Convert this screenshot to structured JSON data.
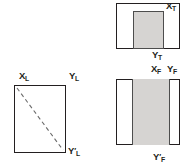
{
  "diagram": {
    "background_color": "#ffffff",
    "outline_color": "#231f20",
    "shade_color": "#d6d4d2",
    "shade_border_color": "#4d4d4d",
    "dash_color": "#6b6b6b",
    "views": [
      {
        "id": "top-view",
        "name": "top-view",
        "shape": "rectangle-with-inset-shaded-block",
        "position": {
          "x": 116,
          "y": 3,
          "width": 64,
          "height": 46
        },
        "shaded_block": {
          "x": 17,
          "y": 8,
          "width": 31,
          "height": 38
        },
        "labels": [
          {
            "id": "x-t",
            "base": "X",
            "sub": "T",
            "prime": false,
            "x": 166,
            "y": 1
          },
          {
            "id": "y-t",
            "base": "Y",
            "sub": "T",
            "prime": false,
            "x": 152,
            "y": 50
          }
        ]
      },
      {
        "id": "left-view",
        "name": "left-view",
        "shape": "rectangle-with-dashed-diagonal",
        "position": {
          "x": 14,
          "y": 85,
          "width": 52,
          "height": 68
        },
        "diagonal": {
          "x1": 3,
          "y1": 3,
          "x2": 49,
          "y2": 65,
          "style": "dashed"
        },
        "labels": [
          {
            "id": "x-l",
            "base": "X",
            "sub": "L",
            "prime": false,
            "x": 19,
            "y": 71
          },
          {
            "id": "y-l",
            "base": "Y",
            "sub": "L",
            "prime": false,
            "x": 69,
            "y": 71
          },
          {
            "id": "y-prime-l",
            "base": "Y",
            "sub": "L",
            "prime": true,
            "x": 68,
            "y": 146
          }
        ]
      },
      {
        "id": "front-view",
        "name": "front-view",
        "shape": "rectangle-with-vertical-shaded-band",
        "position": {
          "x": 116,
          "y": 79,
          "width": 64,
          "height": 66
        },
        "shaded_band": {
          "x": 16,
          "y": 0,
          "width": 38,
          "height": 66
        },
        "labels": [
          {
            "id": "x-f",
            "base": "X",
            "sub": "F",
            "prime": false,
            "x": 151,
            "y": 64
          },
          {
            "id": "y-f",
            "base": "Y",
            "sub": "F",
            "prime": false,
            "x": 167,
            "y": 64
          },
          {
            "id": "y-prime-f",
            "base": "Y",
            "sub": "F",
            "prime": true,
            "x": 153,
            "y": 152
          }
        ]
      }
    ]
  }
}
